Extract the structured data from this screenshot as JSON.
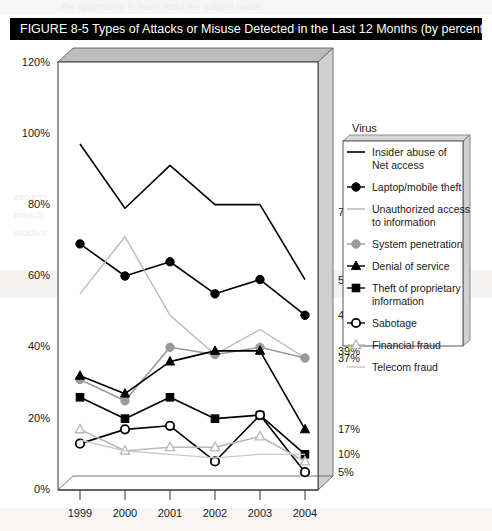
{
  "figure": {
    "label": "FIGURE 8-5",
    "title": "FIGURE 8-5  Types of Attacks or Misuse Detected in the Last 12 Months (by percent)"
  },
  "legend": {
    "heading": "Virus",
    "entries": [
      {
        "label": "Insider abuse of Net access",
        "line1": "Insider abuse of",
        "line2": "Net access",
        "marker": "line-plain-black"
      },
      {
        "label": "Laptop/mobile theft",
        "line1": "Laptop/mobile theft",
        "line2": "",
        "marker": "filled-circle-gray"
      },
      {
        "label": "Unauthorized access to information",
        "line1": "Unauthorized access",
        "line2": "to information",
        "marker": "line-plain-gray"
      },
      {
        "label": "System penetration",
        "line1": "System penetration",
        "line2": "",
        "marker": "filled-circle-midgray"
      },
      {
        "label": "Denial of service",
        "line1": "Denial of service",
        "line2": "",
        "marker": "filled-triangle-black"
      },
      {
        "label": "Theft of proprietary information",
        "line1": "Theft of proprietary",
        "line2": "information",
        "marker": "filled-square-black"
      },
      {
        "label": "Sabotage",
        "line1": "Sabotage",
        "line2": "",
        "marker": "open-circle-black"
      },
      {
        "label": "Financial fraud",
        "line1": "Financial fraud",
        "line2": "",
        "marker": "open-triangle-gray"
      },
      {
        "label": "Telecom fraud",
        "line1": "Telecom fraud",
        "line2": "",
        "marker": "line-plain-lightgray"
      }
    ]
  },
  "colors": {
    "black": "#000000",
    "dark_gray": "#6e6e6e",
    "mid_gray": "#9a9a9a",
    "light_gray": "#b9b9b9",
    "pale_gray": "#c9c9c9",
    "box_wall": "#cfcfcf",
    "box_top": "#bdbdbd",
    "banner": "#000000",
    "banner_text": "#ffffff"
  },
  "end_labels": [
    {
      "value": "78%",
      "y_percent": 78
    },
    {
      "value": "59%",
      "y_percent": 59
    },
    {
      "value": "49%",
      "y_percent": 49
    },
    {
      "value": "39%",
      "y_percent": 39
    },
    {
      "value": "37%",
      "y_percent": 37
    },
    {
      "value": "17%",
      "y_percent": 17
    },
    {
      "value": "10%",
      "y_percent": 10
    },
    {
      "value": "5%",
      "y_percent": 5
    }
  ],
  "chart_data": {
    "type": "line",
    "title": "Types of Attacks or Misuse Detected in the Last 12 Months (by percent)",
    "xlabel": "",
    "ylabel": "",
    "ylim": [
      0,
      120
    ],
    "ytick_labels": [
      "0%",
      "20%",
      "40%",
      "60%",
      "80%",
      "100%",
      "120%"
    ],
    "ytick_values": [
      0,
      20,
      40,
      60,
      80,
      100,
      120
    ],
    "categories": [
      "1999",
      "2000",
      "2001",
      "2002",
      "2003",
      "2004"
    ],
    "x": [
      1999,
      2000,
      2001,
      2002,
      2003,
      2004
    ],
    "grid": false,
    "legend_position": "right",
    "series": [
      {
        "name": "Insider abuse of Net access",
        "values": [
          97,
          79,
          91,
          80,
          80,
          59
        ],
        "end_label": "59%",
        "color": "#000000",
        "marker": "none"
      },
      {
        "name": "Laptop/mobile theft",
        "values": [
          69,
          60,
          64,
          55,
          59,
          49
        ],
        "end_label": "49%",
        "color": "#000000",
        "marker": "circle-filled"
      },
      {
        "name": "Unauthorized access to information",
        "values": [
          55,
          71,
          49,
          38,
          45,
          37
        ],
        "end_label": "37%",
        "color": "#b9b9b9",
        "marker": "none"
      },
      {
        "name": "System penetration",
        "values": [
          31,
          25,
          40,
          38,
          40,
          37
        ],
        "end_label": "37%",
        "color": "#9a9a9a",
        "marker": "circle-filled"
      },
      {
        "name": "Denial of service",
        "values": [
          32,
          27,
          36,
          39,
          39,
          17
        ],
        "end_label": "17%",
        "color": "#000000",
        "marker": "triangle-filled"
      },
      {
        "name": "Theft of proprietary information",
        "values": [
          26,
          20,
          26,
          20,
          21,
          10
        ],
        "end_label": "10%",
        "color": "#000000",
        "marker": "square-filled"
      },
      {
        "name": "Sabotage",
        "values": [
          13,
          17,
          18,
          8,
          21,
          5
        ],
        "end_label": "5%",
        "color": "#000000",
        "marker": "circle-open"
      },
      {
        "name": "Financial fraud",
        "values": [
          17,
          11,
          12,
          12,
          15,
          8
        ],
        "end_label": "8%",
        "color": "#b9b9b9",
        "marker": "triangle-open"
      },
      {
        "name": "Telecom fraud",
        "values": [
          14,
          11,
          10,
          9,
          10,
          10
        ],
        "end_label": "10%",
        "color": "#c9c9c9",
        "marker": "none"
      }
    ]
  },
  "bleed_text": [
    {
      "text": "the opportunity to learn about the subject matter and its",
      "x": 68,
      "y": 6
    },
    {
      "text": "organizations. Many of these computer crimes are",
      "x": 70,
      "y": 52
    },
    {
      "text": "detected in the last 12 months by percent of",
      "x": 150,
      "y": 82
    },
    {
      "text": "respondents reporting each category.",
      "x": 150,
      "y": 100
    },
    {
      "text": "reported to law enforcement agencies.",
      "x": 150,
      "y": 118
    },
    {
      "text": "security",
      "x": 20,
      "y": 196
    },
    {
      "text": "breach",
      "x": 20,
      "y": 214
    },
    {
      "text": "incident",
      "x": 20,
      "y": 232
    }
  ]
}
